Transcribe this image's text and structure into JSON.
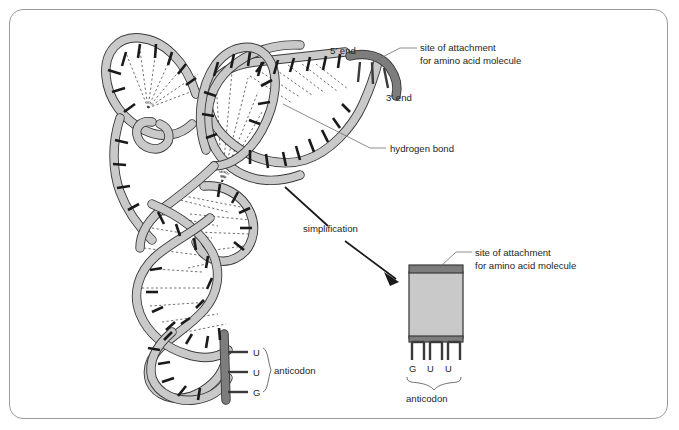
{
  "figure": {
    "labels": {
      "five_prime_end": "5′ end",
      "three_prime_end": "3′ end",
      "attachment_line1": "site of attachment",
      "attachment_line2": "for amino acid molecule",
      "hydrogen_bond": "hydrogen bond",
      "simplification": "simplification",
      "anticodon": "anticodon",
      "attachment_simple_line1": "site of attachment",
      "attachment_simple_line2": "for amino acid molecule",
      "anticodon_simple": "anticodon"
    },
    "detailed_model": {
      "anticodon_bases": [
        "U",
        "U",
        "G"
      ]
    },
    "simplified_model": {
      "anticodon_bases": [
        "G",
        "U",
        "U"
      ]
    },
    "colors": {
      "ribbon_fill": "#c9c9c9",
      "ribbon_outline": "#3a3a3a",
      "ribbon_dark_segment": "#7d7d7d",
      "base_tick": "#1a1a1a",
      "hydrogen_bond": "#3b3b3b",
      "text": "#231f20",
      "frame_border": "#9a9a9a",
      "background": "#ffffff",
      "box_fill": "#c9c9c9",
      "box_bar": "#7d7d7d"
    }
  }
}
